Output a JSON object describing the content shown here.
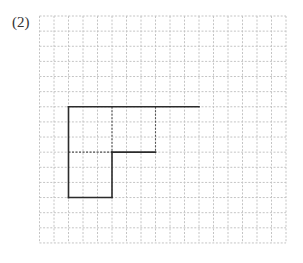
{
  "problem": {
    "label": "(2)"
  },
  "grid": {
    "origin_x": 39.5,
    "origin_y": 16,
    "cols": 17,
    "rows": 15,
    "cell_w": 14.5,
    "cell_h": 15.13,
    "line_color": "#c4c4c4",
    "line_dash": "2,1.6"
  },
  "figure": {
    "stroke_color": "#2b2b2b",
    "dashed_color": "#555555",
    "solid_segments": [
      {
        "from": [
          2,
          6
        ],
        "to": [
          11,
          6
        ]
      },
      {
        "from": [
          2,
          6
        ],
        "to": [
          2,
          12
        ]
      },
      {
        "from": [
          2,
          12
        ],
        "to": [
          5,
          12
        ]
      },
      {
        "from": [
          5,
          12
        ],
        "to": [
          5,
          9
        ]
      },
      {
        "from": [
          5,
          9
        ],
        "to": [
          8,
          9
        ]
      }
    ],
    "dashed_segments": [
      {
        "from": [
          2,
          9
        ],
        "to": [
          5,
          9
        ]
      },
      {
        "from": [
          5,
          6
        ],
        "to": [
          5,
          9
        ]
      },
      {
        "from": [
          8,
          6
        ],
        "to": [
          8,
          9
        ]
      }
    ]
  }
}
